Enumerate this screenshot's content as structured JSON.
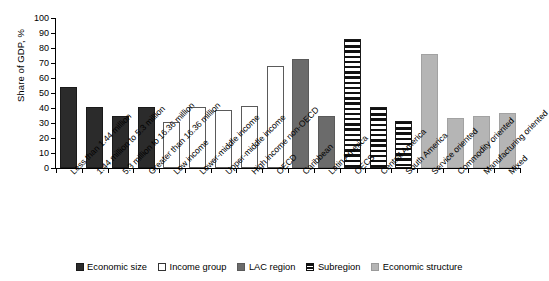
{
  "chart_data": {
    "type": "bar",
    "title": "",
    "xlabel": "",
    "ylabel": "Share of GDP, %",
    "ylim": [
      0,
      100
    ],
    "yticks": [
      0,
      10,
      20,
      30,
      40,
      50,
      60,
      70,
      80,
      90,
      100
    ],
    "grid": false,
    "legend_position": "bottom-center",
    "categories": [
      "Less than 1.44 million",
      "1.44 million to 5.3 million",
      "5.3 million to 16.36 million",
      "Greater than 16.36 million",
      "Low income",
      "Lower-middle income",
      "Upper-middle income",
      "High income non-OECD",
      "OECD",
      "Caribbean",
      "Latin America",
      "OECS",
      "Central America",
      "South America",
      "Service oriented",
      "Commodity oriented",
      "Manufacturing oriented",
      "Mixed"
    ],
    "values": [
      54,
      41,
      35,
      40.5,
      31,
      40.5,
      38.5,
      41.5,
      68,
      73,
      35,
      86,
      40.5,
      31.5,
      76,
      33.5,
      35,
      37
    ],
    "groups": [
      "Economic size",
      "Economic size",
      "Economic size",
      "Economic size",
      "Income group",
      "Income group",
      "Income group",
      "Income group",
      "Income group",
      "LAC region",
      "LAC region",
      "Subregion",
      "Subregion",
      "Subregion",
      "Economic structure",
      "Economic structure",
      "Economic structure",
      "Economic structure"
    ],
    "legend": [
      {
        "label": "Economic size",
        "fill": "solid-black",
        "color": "#2b2b2b"
      },
      {
        "label": "Income group",
        "fill": "outline-white",
        "color": "#ffffff"
      },
      {
        "label": "LAC region",
        "fill": "solid-gray",
        "color": "#6b6b6b"
      },
      {
        "label": "Subregion",
        "fill": "horizontal-stripes",
        "color": "#111111"
      },
      {
        "label": "Economic structure",
        "fill": "solid-lightgray",
        "color": "#b5b5b5"
      }
    ]
  }
}
